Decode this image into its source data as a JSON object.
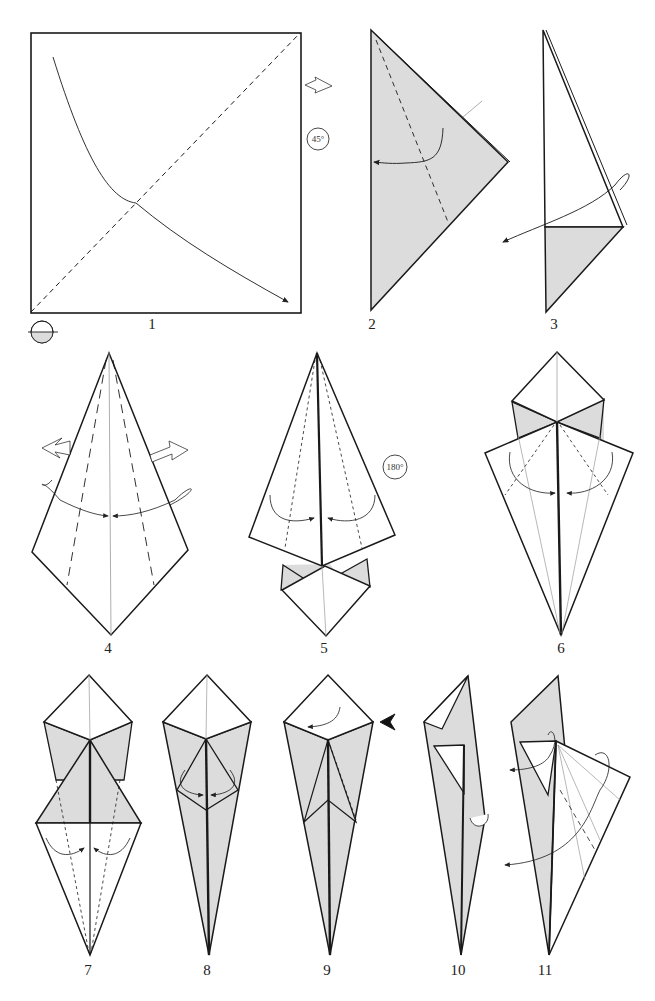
{
  "diagram": {
    "type": "origami-instructions",
    "paper_colors": {
      "front": "#ffffff",
      "back": "#dcdcdc",
      "line": "#1a1a1a"
    },
    "steps": [
      {
        "number": "1",
        "label": "1",
        "description": "Square with diagonal valley fold; arrow folds corner; turn over; rotate 45°"
      },
      {
        "number": "2",
        "label": "2",
        "description": "Triangle (grey side), valley fold along dashed line with arrow"
      },
      {
        "number": "3",
        "label": "3",
        "description": "Reverse fold arrow to left"
      },
      {
        "number": "4",
        "label": "4",
        "description": "Kite base, fold sides to center, unfold arrows"
      },
      {
        "number": "5",
        "label": "5",
        "description": "Fold edges to center, rotate 180°"
      },
      {
        "number": "6",
        "label": "6",
        "description": "Fold flaps to center"
      },
      {
        "number": "7",
        "label": "7",
        "description": "Fold lower edges to center"
      },
      {
        "number": "8",
        "label": "8",
        "description": "Petal fold arrows"
      },
      {
        "number": "9",
        "label": "9",
        "description": "Fold flap left; push arrow"
      },
      {
        "number": "10",
        "label": "10",
        "description": "Open layer"
      },
      {
        "number": "11",
        "label": "11",
        "description": "Swivel and reverse fold"
      }
    ],
    "symbols": {
      "rotate_45": "45°",
      "rotate_180": "180°"
    }
  }
}
